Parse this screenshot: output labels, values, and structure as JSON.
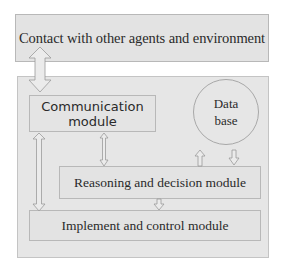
{
  "diagram": {
    "nodes": {
      "environment": "Contact with other agents and environment",
      "communication": "Communication module",
      "communication_line1": "Communication",
      "communication_line2": "module",
      "database_line1": "Data",
      "database_line2": "base",
      "reasoning": "Reasoning and decision module",
      "implement": "Implement and control module"
    },
    "edges": [
      {
        "from": "environment",
        "to": "agent-container",
        "type": "bidirectional"
      },
      {
        "from": "communication",
        "to": "reasoning",
        "type": "bidirectional"
      },
      {
        "from": "communication",
        "to": "implement",
        "type": "bidirectional"
      },
      {
        "from": "reasoning",
        "to": "database",
        "type": "directed"
      },
      {
        "from": "database",
        "to": "reasoning",
        "type": "directed"
      },
      {
        "from": "reasoning",
        "to": "implement",
        "type": "directed"
      }
    ],
    "colors": {
      "box_fill": "#e3e3e3",
      "border": "#b8b8b8",
      "text": "#2a2a2a"
    }
  }
}
